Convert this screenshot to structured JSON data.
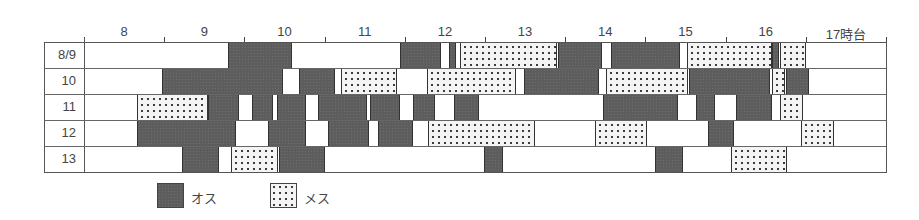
{
  "chart_data": {
    "type": "gantt",
    "title": "",
    "xlabel": "時台",
    "ylabel": "",
    "x_ticks": [
      "8",
      "9",
      "10",
      "11",
      "12",
      "13",
      "14",
      "15",
      "16",
      "17時台"
    ],
    "x_range_hours": [
      8,
      18
    ],
    "rows": [
      "8/9",
      "10",
      "11",
      "12",
      "13"
    ],
    "legend": [
      {
        "key": "male",
        "label": "オス",
        "pattern": "dark gray"
      },
      {
        "key": "female",
        "label": "メス",
        "pattern": "dotted"
      }
    ],
    "segments": [
      {
        "row": "8/9",
        "items": [
          {
            "sex": "male",
            "start": 9.8,
            "end": 10.59
          },
          {
            "sex": "male",
            "start": 11.94,
            "end": 12.45
          },
          {
            "sex": "male",
            "start": 12.55,
            "end": 12.64
          },
          {
            "sex": "female",
            "start": 12.69,
            "end": 13.9
          },
          {
            "sex": "male",
            "start": 13.91,
            "end": 14.46
          },
          {
            "sex": "male",
            "start": 14.57,
            "end": 15.43
          },
          {
            "sex": "female",
            "start": 15.52,
            "end": 16.58
          },
          {
            "sex": "male",
            "start": 16.58,
            "end": 16.67
          },
          {
            "sex": "female",
            "start": 16.68,
            "end": 17.0
          }
        ]
      },
      {
        "row": "10",
        "items": [
          {
            "sex": "male",
            "start": 8.97,
            "end": 10.48
          },
          {
            "sex": "male",
            "start": 10.68,
            "end": 11.13
          },
          {
            "sex": "female",
            "start": 11.2,
            "end": 11.9
          },
          {
            "sex": "female",
            "start": 12.28,
            "end": 13.39
          },
          {
            "sex": "male",
            "start": 13.49,
            "end": 14.42
          },
          {
            "sex": "female",
            "start": 14.51,
            "end": 15.53
          },
          {
            "sex": "male",
            "start": 15.54,
            "end": 16.55
          },
          {
            "sex": "female",
            "start": 16.58,
            "end": 16.74
          },
          {
            "sex": "male",
            "start": 16.75,
            "end": 17.04
          }
        ]
      },
      {
        "row": "11",
        "items": [
          {
            "sex": "female",
            "start": 8.66,
            "end": 9.55
          },
          {
            "sex": "male",
            "start": 9.55,
            "end": 9.93
          },
          {
            "sex": "male",
            "start": 10.09,
            "end": 10.36
          },
          {
            "sex": "male",
            "start": 10.41,
            "end": 10.77
          },
          {
            "sex": "male",
            "start": 10.92,
            "end": 11.53
          },
          {
            "sex": "male",
            "start": 11.57,
            "end": 11.94
          },
          {
            "sex": "male",
            "start": 12.1,
            "end": 12.38
          },
          {
            "sex": "male",
            "start": 12.61,
            "end": 12.93
          },
          {
            "sex": "male",
            "start": 14.47,
            "end": 15.41
          },
          {
            "sex": "male",
            "start": 15.63,
            "end": 15.87
          },
          {
            "sex": "male",
            "start": 16.13,
            "end": 16.58
          },
          {
            "sex": "female",
            "start": 16.68,
            "end": 16.97
          }
        ]
      },
      {
        "row": "12",
        "items": [
          {
            "sex": "male",
            "start": 8.66,
            "end": 9.9
          },
          {
            "sex": "male",
            "start": 10.29,
            "end": 10.77
          },
          {
            "sex": "male",
            "start": 11.04,
            "end": 11.55
          },
          {
            "sex": "male",
            "start": 11.67,
            "end": 12.1
          },
          {
            "sex": "female",
            "start": 12.29,
            "end": 13.62
          },
          {
            "sex": "female",
            "start": 14.37,
            "end": 15.02
          },
          {
            "sex": "male",
            "start": 15.78,
            "end": 16.1
          },
          {
            "sex": "female",
            "start": 16.94,
            "end": 17.35
          }
        ]
      },
      {
        "row": "13",
        "items": [
          {
            "sex": "male",
            "start": 9.22,
            "end": 9.68
          },
          {
            "sex": "female",
            "start": 9.83,
            "end": 10.42
          },
          {
            "sex": "male",
            "start": 10.43,
            "end": 11.01
          },
          {
            "sex": "male",
            "start": 12.99,
            "end": 13.23
          },
          {
            "sex": "male",
            "start": 15.12,
            "end": 15.47
          },
          {
            "sex": "female",
            "start": 16.07,
            "end": 16.77
          }
        ]
      }
    ]
  }
}
